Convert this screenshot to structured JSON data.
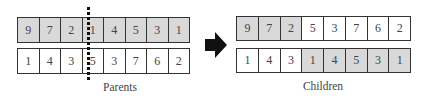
{
  "parents": {
    "label": "Parents",
    "rows": [
      {
        "values": [
          "9",
          "7",
          "2",
          "1",
          "4",
          "5",
          "3",
          "1"
        ],
        "shaded": [
          true,
          true,
          true,
          true,
          true,
          true,
          true,
          true
        ]
      },
      {
        "values": [
          "1",
          "4",
          "3",
          "5",
          "3",
          "7",
          "6",
          "2"
        ],
        "shaded": [
          false,
          false,
          false,
          false,
          false,
          false,
          false,
          false
        ]
      }
    ],
    "crossover_point_after_index": 2
  },
  "arrow": {
    "icon": "right-arrow-icon",
    "color": "#111111"
  },
  "children": {
    "label": "Children",
    "rows": [
      {
        "values": [
          "9",
          "7",
          "2",
          "5",
          "3",
          "7",
          "6",
          "2"
        ],
        "shaded": [
          true,
          true,
          true,
          false,
          false,
          false,
          false,
          false
        ]
      },
      {
        "values": [
          "1",
          "4",
          "3",
          "1",
          "4",
          "5",
          "3",
          "1"
        ],
        "shaded": [
          false,
          false,
          false,
          true,
          true,
          true,
          true,
          true
        ]
      }
    ]
  },
  "colors": {
    "shaded_cell": "#d9d9d9",
    "plain_cell": "#ffffff",
    "border": "#333333"
  }
}
